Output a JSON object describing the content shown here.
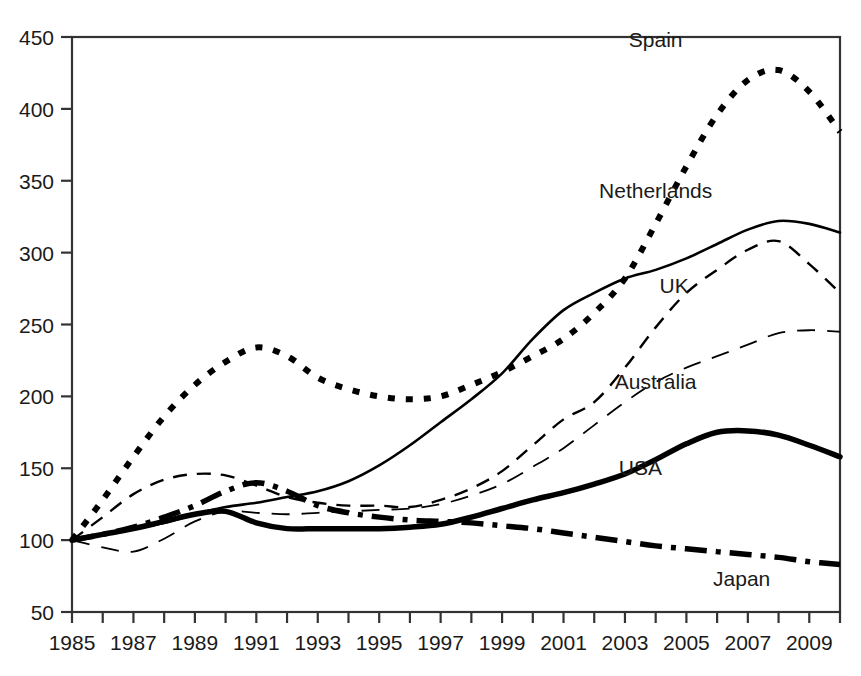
{
  "chart_data": {
    "type": "line",
    "title": "",
    "subtitle": "",
    "xlabel": "",
    "ylabel": "",
    "xlim": [
      1985,
      2010
    ],
    "ylim": [
      50,
      450
    ],
    "grid": false,
    "legend_position": "inline-labels",
    "y_ticks": [
      50,
      100,
      150,
      200,
      250,
      300,
      350,
      400,
      450
    ],
    "x_ticks_major": [
      1985,
      1987,
      1989,
      1991,
      1993,
      1995,
      1997,
      1999,
      2001,
      2003,
      2005,
      2007,
      2009
    ],
    "x_ticks_minor": [
      1986,
      1988,
      1990,
      1992,
      1994,
      1996,
      1998,
      2000,
      2002,
      2004,
      2006,
      2008,
      2010
    ],
    "x": [
      1985,
      1986,
      1987,
      1988,
      1989,
      1990,
      1991,
      1992,
      1993,
      1994,
      1995,
      1996,
      1997,
      1998,
      1999,
      2000,
      2001,
      2002,
      2003,
      2004,
      2005,
      2006,
      2007,
      2008,
      2009,
      2010
    ],
    "series": [
      {
        "name": "Spain",
        "label": "Spain",
        "style": "thick-dotted",
        "color": "#000000",
        "width": 6,
        "dash": "7 11",
        "values": [
          100,
          128,
          158,
          186,
          208,
          224,
          234,
          228,
          213,
          205,
          200,
          198,
          200,
          208,
          217,
          228,
          240,
          258,
          282,
          320,
          360,
          396,
          420,
          427,
          412,
          384
        ]
      },
      {
        "name": "Netherlands",
        "label": "Netherlands",
        "style": "thin-solid",
        "color": "#000000",
        "width": 2.6,
        "dash": "none",
        "values": [
          100,
          104,
          108,
          112,
          118,
          123,
          126,
          130,
          134,
          141,
          152,
          166,
          182,
          198,
          216,
          240,
          260,
          272,
          282,
          288,
          296,
          306,
          316,
          322,
          320,
          314
        ]
      },
      {
        "name": "UK",
        "label": "UK",
        "style": "medium-dashed",
        "color": "#000000",
        "width": 2.4,
        "dash": "14 10",
        "values": [
          100,
          116,
          132,
          142,
          146,
          145,
          138,
          130,
          126,
          124,
          124,
          123,
          128,
          136,
          148,
          166,
          184,
          196,
          220,
          248,
          272,
          288,
          302,
          308,
          292,
          272
        ]
      },
      {
        "name": "Australia",
        "label": "Australia",
        "style": "thin-long-dashed",
        "color": "#000000",
        "width": 1.8,
        "dash": "18 12",
        "values": [
          100,
          95,
          92,
          101,
          113,
          120,
          119,
          118,
          119,
          120,
          121,
          122,
          125,
          131,
          139,
          151,
          164,
          180,
          196,
          210,
          220,
          228,
          236,
          244,
          246,
          245
        ]
      },
      {
        "name": "USA",
        "label": "USA",
        "style": "thick-solid",
        "color": "#000000",
        "width": 5.5,
        "dash": "none",
        "values": [
          100,
          104,
          108,
          113,
          118,
          120,
          112,
          108,
          108,
          108,
          108,
          109,
          111,
          116,
          122,
          128,
          133,
          139,
          146,
          156,
          167,
          175,
          176,
          173,
          166,
          158
        ]
      },
      {
        "name": "Japan",
        "label": "Japan",
        "style": "thick-dash-dot",
        "color": "#000000",
        "width": 5.5,
        "dash": "22 9 5 9",
        "values": [
          100,
          104,
          109,
          116,
          124,
          134,
          140,
          134,
          124,
          119,
          116,
          114,
          113,
          112,
          110,
          108,
          105,
          102,
          99,
          96,
          94,
          92,
          90,
          88,
          85,
          83
        ]
      }
    ],
    "annotations": [
      {
        "text": "Spain",
        "x": 2004.0,
        "y": 443
      },
      {
        "text": "Netherlands",
        "x": 2004.0,
        "y": 338
      },
      {
        "text": "UK",
        "x": 2004.6,
        "y": 272
      },
      {
        "text": "Australia",
        "x": 2004.0,
        "y": 205
      },
      {
        "text": "USA",
        "x": 2003.5,
        "y": 145
      },
      {
        "text": "Japan",
        "x": 2006.8,
        "y": 68
      }
    ]
  },
  "axes": {
    "y_tick_labels": [
      "450",
      "400",
      "350",
      "300",
      "250",
      "200",
      "150",
      "100",
      "50"
    ],
    "x_tick_labels": [
      "1985",
      "1987",
      "1989",
      "1991",
      "1993",
      "1995",
      "1997",
      "1999",
      "2001",
      "2003",
      "2005",
      "2007",
      "2009"
    ]
  }
}
